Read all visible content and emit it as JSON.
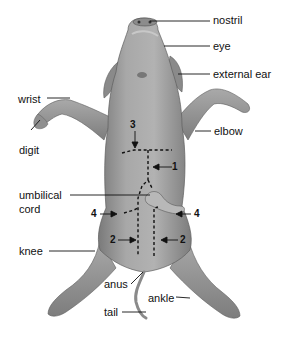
{
  "diagram": {
    "labels": {
      "nostril": "nostril",
      "eye": "eye",
      "external_ear": "external ear",
      "wrist": "wrist",
      "digit": "digit",
      "elbow": "elbow",
      "umbilical_cord_line1": "umbilical",
      "umbilical_cord_line2": "cord",
      "knee": "knee",
      "anus": "anus",
      "ankle": "ankle",
      "tail": "tail"
    },
    "incision_markers": {
      "m1": "1",
      "m2_left": "2",
      "m2_right": "2",
      "m3": "3",
      "m4_left": "4",
      "m4_right": "4"
    },
    "colors": {
      "skin": "#9a9a9a",
      "skin_shadow": "#6f6f6f",
      "skin_highlight": "#c4c4c4",
      "lines": "#111111",
      "background": "#ffffff"
    }
  }
}
